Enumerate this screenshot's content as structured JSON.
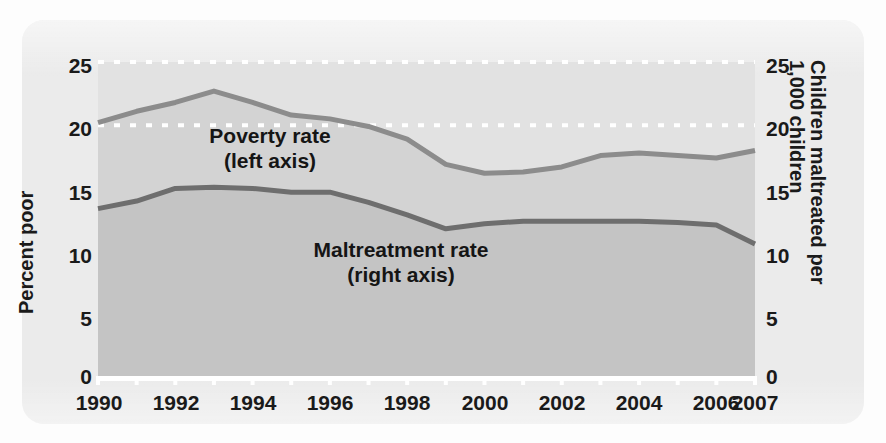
{
  "figure": {
    "background_color": "#ebebeb",
    "plot_upper_fill": "#e2e2e2",
    "poverty_band_fill": "#d3d3d3",
    "maltreatment_band_fill": "#c4c4c4",
    "poverty_line_color": "#8c8c8c",
    "maltreatment_line_color": "#6e6e6e",
    "gridline_color": "#ffffff",
    "text_color": "#1a1a1a"
  },
  "axes": {
    "left_title": "Percent poor",
    "right_title_line1": "Children maltreated per",
    "right_title_line2": "1,000 children",
    "left_ticks": [
      "25",
      "20",
      "15",
      "10",
      "5",
      "0"
    ],
    "right_ticks": [
      "25",
      "20",
      "15",
      "10",
      "5",
      "0"
    ],
    "x_ticks": [
      "1990",
      "1992",
      "1994",
      "1996",
      "1998",
      "2000",
      "2002",
      "2004",
      "2006",
      "2007"
    ]
  },
  "annotations": {
    "poverty_label_line1": "Poverty rate",
    "poverty_label_line2": "(left axis)",
    "maltreatment_label_line1": "Maltreatment rate",
    "maltreatment_label_line2": "(right axis)"
  },
  "chart_data": {
    "type": "line",
    "title": "",
    "subtitle": "",
    "xlabel": "",
    "ylabel": "Percent poor",
    "y2label": "Children maltreated per 1,000 children",
    "xlim": [
      1990,
      2007
    ],
    "ylim": [
      0,
      25
    ],
    "y2lim": [
      0,
      25
    ],
    "grid": true,
    "gridlines": [
      20,
      25
    ],
    "legend_position": "inline-annotations",
    "x": [
      1990,
      1991,
      1992,
      1993,
      1994,
      1995,
      1996,
      1997,
      1998,
      1999,
      2000,
      2001,
      2002,
      2003,
      2004,
      2005,
      2006,
      2007
    ],
    "series": [
      {
        "name": "Poverty rate (left axis)",
        "axis": "left",
        "unit": "percent",
        "color": "#8c8c8c",
        "values": [
          20.2,
          21.1,
          21.8,
          22.7,
          21.8,
          20.8,
          20.5,
          19.9,
          18.9,
          16.9,
          16.2,
          16.3,
          16.7,
          17.6,
          17.8,
          17.6,
          17.4,
          18.0
        ]
      },
      {
        "name": "Maltreatment rate (right axis)",
        "axis": "right",
        "unit": "per 1,000 children",
        "color": "#6e6e6e",
        "values": [
          13.4,
          14.0,
          15.0,
          15.1,
          15.0,
          14.7,
          14.7,
          13.9,
          12.9,
          11.8,
          12.2,
          12.4,
          12.4,
          12.4,
          12.4,
          12.3,
          12.1,
          10.6
        ]
      }
    ]
  }
}
